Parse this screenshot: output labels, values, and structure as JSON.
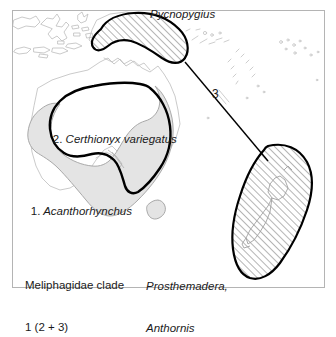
{
  "figure": {
    "type": "biogeographic-distribution-map",
    "frame_color": "#b4b4b4",
    "background_color": "#ffffff",
    "coastline_color": "#b9b9b9",
    "range_fill_grey": "#e4e4e4",
    "range_outline_grey": "#a8a8a8",
    "hatch_color": "#4d4d4d",
    "bold_outline_color": "#000000",
    "connector_color": "#000000"
  },
  "labels": {
    "pycnopygius": {
      "text": "Pycnopygius",
      "style": "italic",
      "x": 150,
      "y": 8
    },
    "certhionyx": {
      "number": "2.",
      "species": "Certhionyx variegatus",
      "text": "2. Certhionyx variegatus",
      "style": "mixed",
      "x": 40,
      "y": 119
    },
    "acanthorhynchus": {
      "number": "1.",
      "species": "Acanthorhynchus",
      "text": "1. Acanthorhynchus",
      "style": "mixed",
      "x": 18,
      "y": 191
    },
    "clade": {
      "line1": "Meliphagidae clade",
      "line2": "1 (2 + 3)",
      "style": "upright",
      "x": 25,
      "y": 251
    },
    "newzealand_taxa": {
      "line1": "Prosthemadera,",
      "line2": "Anthornis",
      "style": "italic",
      "x": 146,
      "y": 252
    },
    "connector_number": {
      "text": "3",
      "style": "upright",
      "x": 212,
      "y": 88
    }
  },
  "regions": [
    {
      "name": "new-guinea-range",
      "taxon": "Pycnopygius",
      "fill": "hatched",
      "outline": "bold-black"
    },
    {
      "name": "australia-coastal-range",
      "taxon": "Acanthorhynchus",
      "clade_number": "1",
      "fill": "solid-grey",
      "outline": "thin-grey"
    },
    {
      "name": "australia-arid-range",
      "taxon": "Certhionyx variegatus",
      "clade_number": "2",
      "fill": "none",
      "outline": "bold-black"
    },
    {
      "name": "new-zealand-range",
      "taxon": "Prosthemadera, Anthornis",
      "clade_number": "3",
      "fill": "hatched",
      "outline": "bold-black"
    }
  ],
  "connector": {
    "name": "new-guinea-to-new-zealand-connector",
    "label": "3",
    "from": "new-guinea-range",
    "to": "new-zealand-range"
  }
}
